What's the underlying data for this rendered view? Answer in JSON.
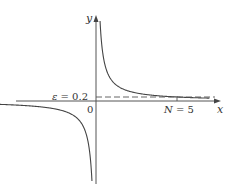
{
  "chart_data": {
    "type": "line",
    "title": "",
    "xlabel": "x",
    "ylabel": "y",
    "origin_label": "0",
    "function": "y = 1/x",
    "xlim": [
      -6,
      7.5
    ],
    "ylim": [
      -4,
      4.5
    ],
    "grid": false,
    "series": [
      {
        "name": "1/x (x>0)",
        "x": [
          0.25,
          0.3,
          0.4,
          0.5,
          0.75,
          1,
          1.5,
          2,
          3,
          4,
          5,
          6,
          7
        ],
        "y": [
          4,
          3.333,
          2.5,
          2,
          1.333,
          1,
          0.667,
          0.5,
          0.333,
          0.25,
          0.2,
          0.167,
          0.143
        ]
      },
      {
        "name": "1/x (x<0)",
        "x": [
          -6,
          -5,
          -4,
          -3,
          -2,
          -1.5,
          -1,
          -0.75,
          -0.5,
          -0.4,
          -0.3,
          -0.25
        ],
        "y": [
          -0.167,
          -0.2,
          -0.25,
          -0.333,
          -0.5,
          -0.667,
          -1,
          -1.333,
          -2,
          -2.5,
          -3.333,
          -4
        ]
      }
    ],
    "annotations": [
      {
        "type": "hline",
        "y": 0.2,
        "style": "dashed",
        "label": "ε = 0.2",
        "label_parts": {
          "symbol": "ε",
          "rest": " = 0.2"
        }
      },
      {
        "type": "xtick",
        "x": 5,
        "label": "N = 5",
        "label_parts": {
          "symbol": "N",
          "rest": " = 5"
        }
      }
    ]
  }
}
